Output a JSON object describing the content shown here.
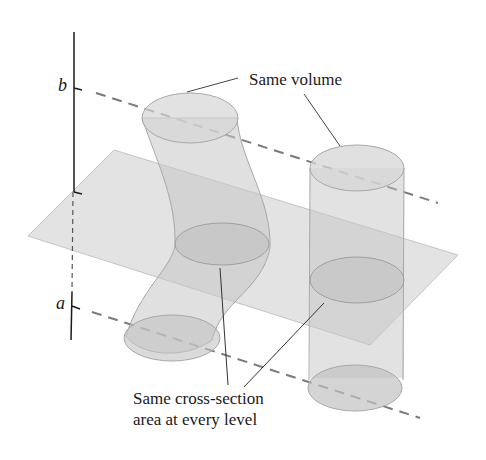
{
  "figure": {
    "axis_labels": {
      "top": "b",
      "bottom": "a"
    },
    "annotations": {
      "top": "Same volume",
      "bottom_line1": "Same cross-section",
      "bottom_line2": "area at every level"
    },
    "colors": {
      "plane": "#dcdcdc",
      "solid_fill": "#c8c8c8",
      "solid_edge": "#a8a8a8",
      "dashed_line": "#7a7a7a",
      "axis": "#1a1a1a"
    }
  }
}
